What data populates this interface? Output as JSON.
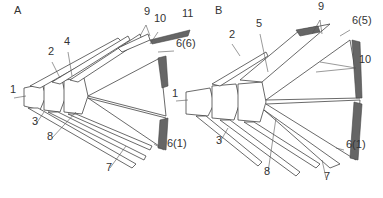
{
  "figure": {
    "panels": [
      {
        "id": "A",
        "labels": [
          {
            "text": "A",
            "x": 14,
            "y": 14
          },
          {
            "text": "1",
            "x": 10,
            "y": 93
          },
          {
            "text": "2",
            "x": 48,
            "y": 55
          },
          {
            "text": "3",
            "x": 32,
            "y": 125
          },
          {
            "text": "4",
            "x": 64,
            "y": 45
          },
          {
            "text": "8",
            "x": 47,
            "y": 140
          },
          {
            "text": "7",
            "x": 106,
            "y": 171
          },
          {
            "text": "6(1)",
            "x": 167,
            "y": 147
          },
          {
            "text": "6(6)",
            "x": 176,
            "y": 47
          },
          {
            "text": "9",
            "x": 144,
            "y": 15
          },
          {
            "text": "10",
            "x": 154,
            "y": 22
          },
          {
            "text": "11",
            "x": 182,
            "y": 17
          }
        ]
      },
      {
        "id": "B",
        "labels": [
          {
            "text": "B",
            "x": 215,
            "y": 14
          },
          {
            "text": "1",
            "x": 172,
            "y": 97
          },
          {
            "text": "2",
            "x": 229,
            "y": 38
          },
          {
            "text": "3",
            "x": 216,
            "y": 144
          },
          {
            "text": "5",
            "x": 256,
            "y": 27
          },
          {
            "text": "8",
            "x": 264,
            "y": 175
          },
          {
            "text": "7",
            "x": 324,
            "y": 180
          },
          {
            "text": "6(1)",
            "x": 346,
            "y": 148
          },
          {
            "text": "6(5)",
            "x": 352,
            "y": 24
          },
          {
            "text": "9",
            "x": 318,
            "y": 10
          },
          {
            "text": "10",
            "x": 359,
            "y": 63
          }
        ]
      }
    ]
  }
}
